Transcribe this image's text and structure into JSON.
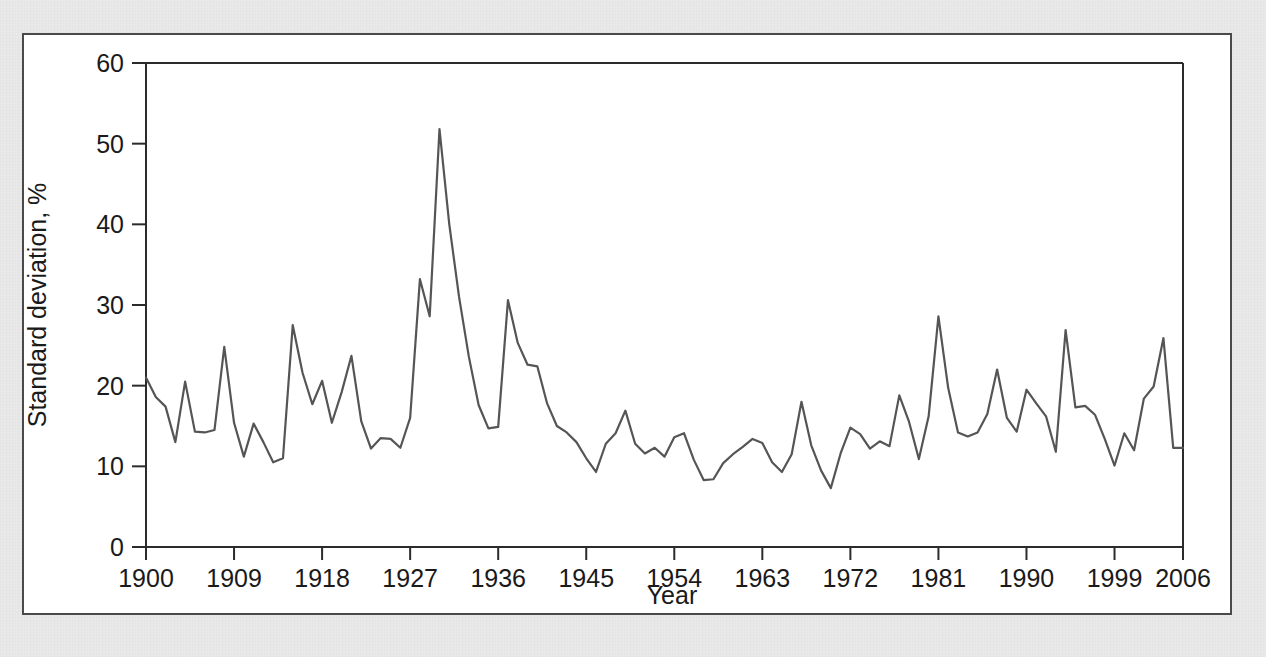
{
  "figure": {
    "background_color": "#e9e9e9",
    "panel_color": "#ffffff",
    "border_color": "#4a4a4a",
    "line_color": "#555555"
  },
  "chart_data": {
    "type": "line",
    "title": "",
    "subtitle": "",
    "xlabel": "Year",
    "ylabel": "Standard deviation, %",
    "xlim": [
      1900,
      2006
    ],
    "ylim": [
      0,
      60
    ],
    "grid": false,
    "legend": null,
    "legend_position": "none",
    "xticks": [
      1900,
      1909,
      1918,
      1927,
      1936,
      1945,
      1954,
      1963,
      1972,
      1981,
      1990,
      1999,
      2006
    ],
    "xtick_labels": [
      "1900",
      "1909",
      "1918",
      "1927",
      "1936",
      "1945",
      "1954",
      "1963",
      "1972",
      "1981",
      "1990",
      "1999",
      "2006"
    ],
    "yticks": [
      0,
      10,
      20,
      30,
      40,
      50,
      60
    ],
    "ytick_labels": [
      "0",
      "10",
      "20",
      "30",
      "40",
      "50",
      "60"
    ],
    "series": [
      {
        "name": "Standard deviation",
        "color": "#555555",
        "x": [
          1900,
          1901,
          1902,
          1903,
          1904,
          1905,
          1906,
          1907,
          1908,
          1909,
          1910,
          1911,
          1912,
          1913,
          1914,
          1915,
          1916,
          1917,
          1918,
          1919,
          1920,
          1921,
          1922,
          1923,
          1924,
          1925,
          1926,
          1927,
          1928,
          1929,
          1930,
          1931,
          1932,
          1933,
          1934,
          1935,
          1936,
          1937,
          1938,
          1939,
          1940,
          1941,
          1942,
          1943,
          1944,
          1945,
          1946,
          1947,
          1948,
          1949,
          1950,
          1951,
          1952,
          1953,
          1954,
          1955,
          1956,
          1957,
          1958,
          1959,
          1960,
          1961,
          1962,
          1963,
          1964,
          1965,
          1966,
          1967,
          1968,
          1969,
          1970,
          1971,
          1972,
          1973,
          1974,
          1975,
          1976,
          1977,
          1978,
          1979,
          1980,
          1981,
          1982,
          1983,
          1984,
          1985,
          1986,
          1987,
          1988,
          1989,
          1990,
          1991,
          1992,
          1993,
          1994,
          1995,
          1996,
          1997,
          1998,
          1999,
          2000,
          2001,
          2002,
          2003,
          2004,
          2005,
          2006
        ],
        "values": [
          21.0,
          18.6,
          17.4,
          13.0,
          20.5,
          14.3,
          14.2,
          14.5,
          24.8,
          15.4,
          11.2,
          15.3,
          13.0,
          10.5,
          11.0,
          27.5,
          21.6,
          17.7,
          20.6,
          15.4,
          19.2,
          23.7,
          15.6,
          12.2,
          13.5,
          13.4,
          12.3,
          16.0,
          33.2,
          28.6,
          51.8,
          40.0,
          31.0,
          23.6,
          17.6,
          14.7,
          14.9,
          30.6,
          25.3,
          22.6,
          22.4,
          17.8,
          15.0,
          14.2,
          13.0,
          11.0,
          9.3,
          12.8,
          14.1,
          16.9,
          12.8,
          11.6,
          12.3,
          11.2,
          13.6,
          14.1,
          10.8,
          8.3,
          8.4,
          10.4,
          11.5,
          12.4,
          13.4,
          12.9,
          10.5,
          9.3,
          11.5,
          18.0,
          12.6,
          9.5,
          7.3,
          11.6,
          14.8,
          14.0,
          12.2,
          13.1,
          12.5,
          18.8,
          15.5,
          10.9,
          16.2,
          28.6,
          19.7,
          14.2,
          13.7,
          14.2,
          16.5,
          22.0,
          16.0,
          14.3,
          19.5,
          17.8,
          16.2,
          11.8,
          26.9,
          17.3,
          17.5,
          16.4,
          13.4,
          10.1,
          14.1,
          12.0,
          18.4,
          19.9,
          25.9,
          12.3,
          12.3
        ]
      }
    ]
  }
}
